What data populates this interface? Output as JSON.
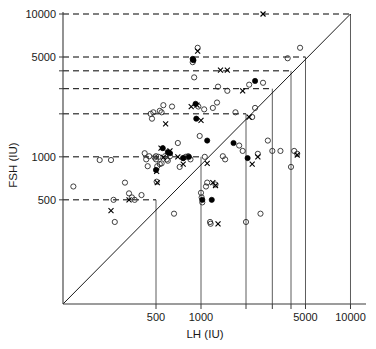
{
  "chart_data": {
    "type": "scatter",
    "title": "",
    "xlabel": "LH (IU)",
    "ylabel": "FSH (IU)",
    "xscale": "log",
    "yscale": "log",
    "xlim": [
      100,
      13000
    ],
    "ylim": [
      230,
      11500
    ],
    "grid": true,
    "legend": "none",
    "xticks": [
      500,
      1000,
      2000,
      3000,
      4000,
      5000,
      10000
    ],
    "xtick_labels": [
      "500",
      "1000",
      "",
      "",
      "",
      "5000",
      "10000"
    ],
    "yticks": [
      500,
      1000,
      2000,
      3000,
      4000,
      5000,
      10000
    ],
    "ytick_labels": [
      "500",
      "1000",
      "",
      "",
      "",
      "5000",
      "10000"
    ],
    "dashed_gridlines_y": [
      500,
      1000,
      2000,
      3000,
      4000,
      5000,
      10000
    ],
    "solid_gridlines_x": [
      500,
      1000,
      2000,
      3000,
      4000,
      5000,
      10000
    ],
    "identity_line": {
      "from": [
        230,
        230
      ],
      "to": [
        11000,
        11000
      ],
      "note": "y = x diagonal"
    },
    "series": [
      {
        "name": "open-circle",
        "marker": "open-circle",
        "points": [
          [
            140,
            620
          ],
          [
            210,
            950
          ],
          [
            250,
            950
          ],
          [
            260,
            500
          ],
          [
            265,
            350
          ],
          [
            310,
            660
          ],
          [
            330,
            555
          ],
          [
            345,
            520
          ],
          [
            360,
            500
          ],
          [
            400,
            540
          ],
          [
            420,
            1060
          ],
          [
            430,
            960
          ],
          [
            440,
            860
          ],
          [
            450,
            1010
          ],
          [
            460,
            2000
          ],
          [
            470,
            1850
          ],
          [
            480,
            2050
          ],
          [
            490,
            990
          ],
          [
            500,
            960
          ],
          [
            505,
            670
          ],
          [
            510,
            860
          ],
          [
            520,
            1000
          ],
          [
            530,
            2100
          ],
          [
            545,
            2050
          ],
          [
            560,
            2300
          ],
          [
            575,
            1010
          ],
          [
            590,
            960
          ],
          [
            600,
            940
          ],
          [
            640,
            2250
          ],
          [
            660,
            400
          ],
          [
            700,
            1250
          ],
          [
            720,
            850
          ],
          [
            760,
            980
          ],
          [
            790,
            1000
          ],
          [
            820,
            1010
          ],
          [
            850,
            960
          ],
          [
            880,
            4600
          ],
          [
            900,
            3600
          ],
          [
            950,
            5800
          ],
          [
            960,
            2250
          ],
          [
            980,
            1400
          ],
          [
            1000,
            560
          ],
          [
            1010,
            520
          ],
          [
            1020,
            480
          ],
          [
            1050,
            2150
          ],
          [
            1060,
            1000
          ],
          [
            1080,
            620
          ],
          [
            1100,
            660
          ],
          [
            1150,
            350
          ],
          [
            1160,
            340
          ],
          [
            1200,
            2200
          ],
          [
            1250,
            640
          ],
          [
            1280,
            2400
          ],
          [
            1300,
            3100
          ],
          [
            1400,
            1010
          ],
          [
            1450,
            960
          ],
          [
            1500,
            2900
          ],
          [
            1700,
            2050
          ],
          [
            1800,
            1200
          ],
          [
            1900,
            1100
          ],
          [
            2000,
            350
          ],
          [
            2100,
            3200
          ],
          [
            2200,
            1900
          ],
          [
            2300,
            2200
          ],
          [
            2400,
            1050
          ],
          [
            2500,
            400
          ],
          [
            2600,
            3300
          ],
          [
            2800,
            1300
          ],
          [
            3000,
            1100
          ],
          [
            3400,
            1100
          ],
          [
            3800,
            4900
          ],
          [
            4000,
            850
          ],
          [
            4200,
            1100
          ],
          [
            4400,
            1050
          ],
          [
            4600,
            5800
          ],
          [
            500,
            1010
          ],
          [
            530,
            890
          ],
          [
            545,
            900
          ],
          [
            620,
            1010
          ]
        ]
      },
      {
        "name": "filled-circle",
        "marker": "filled-circle",
        "points": [
          [
            500,
            810
          ],
          [
            555,
            1150
          ],
          [
            600,
            1080
          ],
          [
            620,
            1060
          ],
          [
            760,
            980
          ],
          [
            830,
            1000
          ],
          [
            880,
            4850
          ],
          [
            890,
            4750
          ],
          [
            920,
            2350
          ],
          [
            930,
            1850
          ],
          [
            1020,
            500
          ],
          [
            1100,
            1300
          ],
          [
            1180,
            500
          ],
          [
            1650,
            1250
          ],
          [
            2300,
            3400
          ],
          [
            2050,
            980
          ]
        ]
      },
      {
        "name": "cross",
        "marker": "cross",
        "points": [
          [
            250,
            420
          ],
          [
            330,
            500
          ],
          [
            505,
            790
          ],
          [
            510,
            660
          ],
          [
            540,
            1150
          ],
          [
            560,
            990
          ],
          [
            580,
            1700
          ],
          [
            620,
            1100
          ],
          [
            700,
            1000
          ],
          [
            760,
            890
          ],
          [
            860,
            2250
          ],
          [
            940,
            2300
          ],
          [
            950,
            5500
          ],
          [
            1000,
            1800
          ],
          [
            1100,
            900
          ],
          [
            1200,
            660
          ],
          [
            1250,
            630
          ],
          [
            1300,
            340
          ],
          [
            1350,
            4050
          ],
          [
            1500,
            4050
          ],
          [
            1900,
            2900
          ],
          [
            2100,
            1900
          ],
          [
            2200,
            890
          ],
          [
            2400,
            1000
          ],
          [
            2600,
            10000
          ],
          [
            4400,
            1030
          ]
        ]
      }
    ]
  },
  "axes": {
    "y_title": "FSH (IU)",
    "x_title": "LH (IU)",
    "y_tick_texts": [
      "10000",
      "5000",
      "1000",
      "500"
    ],
    "x_tick_texts": [
      "500",
      "1000",
      "5000",
      "10000"
    ]
  }
}
